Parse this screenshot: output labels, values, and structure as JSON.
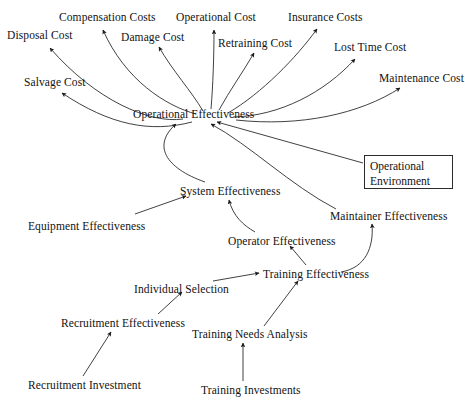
{
  "diagram": {
    "type": "influence-diagram",
    "background_color": "#ffffff",
    "line_color": "#2b2b2b",
    "text_color": "#121212",
    "nodes": [
      {
        "id": "disposal_cost",
        "label": "Disposal Cost",
        "x": 7,
        "y": 29,
        "anchor": "start"
      },
      {
        "id": "compensation_costs",
        "label": "Compensation Costs",
        "x": 59,
        "y": 11,
        "anchor": "start"
      },
      {
        "id": "damage_cost",
        "label": "Damage Cost",
        "x": 121,
        "y": 31,
        "anchor": "start"
      },
      {
        "id": "operational_cost",
        "label": "Operational Cost",
        "x": 176,
        "y": 11,
        "anchor": "start"
      },
      {
        "id": "retraining_cost",
        "label": "Retraining Cost",
        "x": 218,
        "y": 37,
        "anchor": "start"
      },
      {
        "id": "insurance_costs",
        "label": "Insurance Costs",
        "x": 288,
        "y": 11,
        "anchor": "start"
      },
      {
        "id": "lost_time_cost",
        "label": "Lost Time Cost",
        "x": 334,
        "y": 41,
        "anchor": "start"
      },
      {
        "id": "maintenance_cost",
        "label": "Maintenance Cost",
        "x": 379,
        "y": 72,
        "anchor": "start"
      },
      {
        "id": "salvage_cost",
        "label": "Salvage Cost",
        "x": 24,
        "y": 76,
        "anchor": "start"
      },
      {
        "id": "operational_effectiveness",
        "label": "Operational Effectiveness",
        "x": 133,
        "y": 108,
        "anchor": "start"
      },
      {
        "id": "system_effectiveness",
        "label": "System Effectiveness",
        "x": 180,
        "y": 185,
        "anchor": "start"
      },
      {
        "id": "equipment_effectiveness",
        "label": "Equipment Effectiveness",
        "x": 28,
        "y": 220,
        "anchor": "start"
      },
      {
        "id": "maintainer_effectiveness",
        "label": "Maintainer Effectiveness",
        "x": 330,
        "y": 210,
        "anchor": "start"
      },
      {
        "id": "operator_effectiveness",
        "label": "Operator Effectiveness",
        "x": 228,
        "y": 235,
        "anchor": "start"
      },
      {
        "id": "training_effectiveness",
        "label": "Training Effectiveness",
        "x": 263,
        "y": 268,
        "anchor": "start"
      },
      {
        "id": "individual_selection",
        "label": "Individual Selection",
        "x": 134,
        "y": 283,
        "anchor": "start"
      },
      {
        "id": "recruitment_effectiveness",
        "label": "Recruitment Effectiveness",
        "x": 61,
        "y": 317,
        "anchor": "start"
      },
      {
        "id": "training_needs_analysis",
        "label": "Training Needs Analysis",
        "x": 192,
        "y": 328,
        "anchor": "start"
      },
      {
        "id": "recruitment_investment",
        "label": "Recruitment Investment",
        "x": 28,
        "y": 379,
        "anchor": "start"
      },
      {
        "id": "training_investments",
        "label": "Training Investments",
        "x": 201,
        "y": 384,
        "anchor": "start"
      }
    ],
    "boxed_nodes": [
      {
        "id": "operational_environment",
        "line1": "Operational",
        "line2": "Environment",
        "x": 364,
        "y": 155,
        "width": 89,
        "height": 34
      }
    ],
    "edges": [
      {
        "from": "operational_effectiveness",
        "to": "disposal_cost",
        "style": "curved"
      },
      {
        "from": "operational_effectiveness",
        "to": "salvage_cost",
        "style": "curved"
      },
      {
        "from": "operational_effectiveness",
        "to": "compensation_costs",
        "style": "curved"
      },
      {
        "from": "operational_effectiveness",
        "to": "damage_cost",
        "style": "curved"
      },
      {
        "from": "operational_effectiveness",
        "to": "operational_cost",
        "style": "straight"
      },
      {
        "from": "operational_effectiveness",
        "to": "retraining_cost",
        "style": "straight"
      },
      {
        "from": "operational_effectiveness",
        "to": "insurance_costs",
        "style": "straight"
      },
      {
        "from": "operational_effectiveness",
        "to": "lost_time_cost",
        "style": "curved"
      },
      {
        "from": "operational_effectiveness",
        "to": "maintenance_cost",
        "style": "curved"
      },
      {
        "from": "operational_environment",
        "to": "operational_effectiveness",
        "style": "straight"
      },
      {
        "from": "maintainer_effectiveness",
        "to": "operational_effectiveness",
        "style": "curved"
      },
      {
        "from": "system_effectiveness",
        "to": "operational_effectiveness",
        "style": "curved"
      },
      {
        "from": "equipment_effectiveness",
        "to": "system_effectiveness",
        "style": "straight"
      },
      {
        "from": "operator_effectiveness",
        "to": "system_effectiveness",
        "style": "curved"
      },
      {
        "from": "training_effectiveness",
        "to": "operator_effectiveness",
        "style": "straight"
      },
      {
        "from": "training_effectiveness",
        "to": "maintainer_effectiveness",
        "style": "curved"
      },
      {
        "from": "individual_selection",
        "to": "training_effectiveness",
        "style": "straight"
      },
      {
        "from": "training_needs_analysis",
        "to": "training_effectiveness",
        "style": "straight"
      },
      {
        "from": "recruitment_effectiveness",
        "to": "individual_selection",
        "style": "straight"
      },
      {
        "from": "recruitment_investment",
        "to": "recruitment_effectiveness",
        "style": "straight"
      },
      {
        "from": "training_investments",
        "to": "training_needs_analysis",
        "style": "straight"
      }
    ]
  }
}
